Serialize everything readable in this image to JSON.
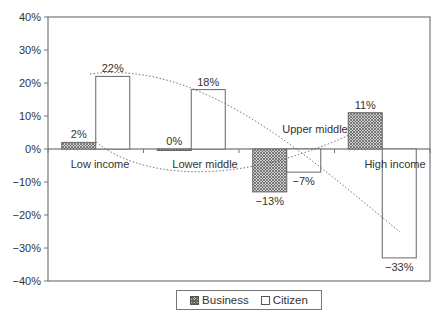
{
  "chart_data": {
    "type": "bar",
    "title": "",
    "xlabel": "",
    "ylabel": "",
    "ylim": [
      -40,
      40
    ],
    "yticks": [
      "40%",
      "30%",
      "20%",
      "10%",
      "0%",
      "-10%",
      "-20%",
      "-30%",
      "-40%"
    ],
    "categories": [
      "Low income",
      "Lower middle",
      "Upper middle",
      "High income"
    ],
    "series": [
      {
        "name": "Business",
        "values": [
          2,
          0,
          -13,
          11
        ],
        "labels": [
          "2%",
          "0%",
          "−13%",
          "11%"
        ],
        "pattern": "crosshatch"
      },
      {
        "name": "Citizen",
        "values": [
          22,
          18,
          -7,
          -33
        ],
        "labels": [
          "22%",
          "18%",
          "−7%",
          "−33%"
        ],
        "pattern": "white"
      }
    ],
    "trendlines": [
      {
        "series": "Business",
        "style": "dotted",
        "shape": "U-curve through bar tops"
      },
      {
        "series": "Citizen",
        "style": "dotted",
        "shape": "downward curve through bar tops"
      }
    ],
    "grid": false,
    "legend_position": "bottom"
  },
  "legend": {
    "business": "Business",
    "citizen": "Citizen"
  },
  "colors": {
    "axis": "#777777",
    "bar_outline": "#666666",
    "business_fill": "#bdbdbd",
    "citizen_fill": "#ffffff",
    "text": "#333333"
  }
}
